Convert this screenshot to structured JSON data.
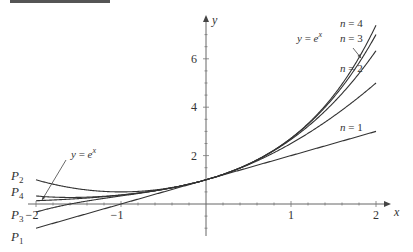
{
  "chart_data": {
    "type": "line",
    "title": "",
    "xlabel": "x",
    "ylabel": "y",
    "xlim": [
      -2.0,
      2.0
    ],
    "ylim": [
      -1.0,
      7.3
    ],
    "xticks": [
      -2,
      -1,
      1,
      2
    ],
    "xtick_labels": [
      "−2",
      "−1",
      "1",
      "2"
    ],
    "yticks": [
      2,
      4,
      6
    ],
    "ytick_labels": [
      "2",
      "4",
      "6"
    ],
    "grid": false,
    "line_color": "#333333",
    "series": [
      {
        "name": "y = e^x",
        "function": "exp(x)",
        "coefficients": null
      },
      {
        "name": "n = 1",
        "left_label": "P1",
        "coefficients": [
          1,
          1
        ]
      },
      {
        "name": "n = 2",
        "left_label": "P2",
        "coefficients": [
          1,
          1,
          0.5
        ]
      },
      {
        "name": "n = 3",
        "left_label": "P3",
        "coefficients": [
          1,
          1,
          0.5,
          0.1666667
        ]
      },
      {
        "name": "n = 4",
        "left_label": "P4",
        "coefficients": [
          1,
          1,
          0.5,
          0.1666667,
          0.0416667
        ]
      }
    ],
    "annotations": [
      {
        "text_main": "y = e",
        "text_sup": "x",
        "points_to": "e^x near x=1.85"
      },
      {
        "text_main": "y = e",
        "text_sup": "x",
        "points_to": "e^x near x=-1.9"
      }
    ],
    "right_labels": [
      "n = 4",
      "n = 3",
      "n = 2",
      "n = 1"
    ],
    "left_labels": [
      {
        "main": "P",
        "sub": "2"
      },
      {
        "main": "P",
        "sub": "4"
      },
      {
        "main": "P",
        "sub": "3"
      },
      {
        "main": "P",
        "sub": "1"
      }
    ]
  }
}
